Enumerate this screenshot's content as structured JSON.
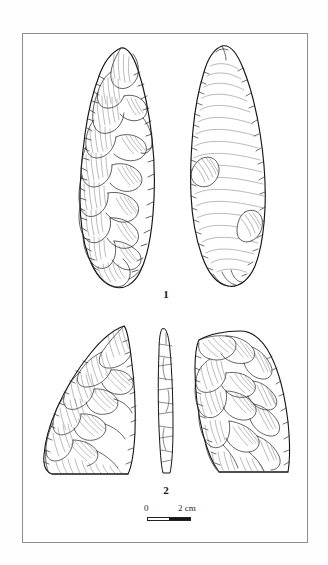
{
  "figure": {
    "kind": "archaeological-lithic-plate",
    "frame_color": "#8d8d8d",
    "ink_color": "#1a1a1a",
    "background": "#ffffff",
    "items": [
      {
        "number": "1",
        "description": "Complete bifacial handaxe shown in two opposed faces",
        "views": [
          {
            "name": "obverse-face",
            "surface": "fully flaked, invasive flake scars with ripple hatching"
          },
          {
            "name": "reverse-face",
            "surface": "smooth face with concentric ripple lines and two flake scars"
          }
        ]
      },
      {
        "number": "2",
        "description": "Broken biface: two conjoining fragments with edge profile",
        "views": [
          {
            "name": "left-fragment",
            "surface": "flaked face with scar hatching"
          },
          {
            "name": "edge-profile",
            "surface": "narrow lateral section of the tool"
          },
          {
            "name": "right-fragment",
            "surface": "flaked face with scar hatching"
          }
        ]
      }
    ],
    "labels": {
      "item_one": "1",
      "item_two": "2"
    },
    "scale": {
      "start_label": "0",
      "end_label": "2 cm",
      "units": "cm",
      "length_value": 2,
      "segments": 2,
      "filled_segment": "right"
    }
  }
}
